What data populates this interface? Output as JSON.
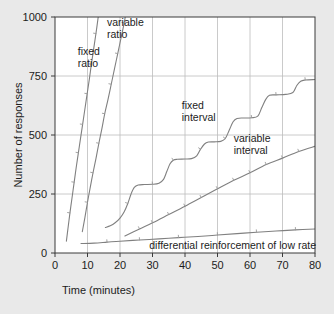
{
  "chart_data": {
    "type": "line",
    "title": "",
    "subtitle": "",
    "xlabel": "Time (minutes)",
    "ylabel": "Number of responses",
    "xlim": [
      0,
      80
    ],
    "ylim": [
      0,
      1000
    ],
    "xticks": [
      0,
      10,
      20,
      30,
      40,
      50,
      60,
      70,
      80
    ],
    "yticks": [
      0,
      250,
      500,
      750,
      1000
    ],
    "xtick_labels": [
      "0",
      "10",
      "20",
      "30",
      "40",
      "50",
      "60",
      "70",
      "80"
    ],
    "ytick_labels": [
      "0",
      "250",
      "500",
      "750",
      "1000"
    ],
    "grid": true,
    "legend_position": "inline-annotations",
    "line_color": "#808080",
    "axis_color": "#3a3a3a",
    "grid_color": "#bdbdbd",
    "plot_bg_color": "#ffffff",
    "figure_bg_color": "#e9e9e9",
    "series": [
      {
        "name": "fixed ratio",
        "label": "fixed\nratio",
        "label_lines": [
          "fixed",
          "ratio"
        ],
        "label_x": 7.0,
        "label_y": 840,
        "points": [
          [
            3.5,
            50
          ],
          [
            4.0,
            105
          ],
          [
            4.6,
            170
          ],
          [
            5.2,
            230
          ],
          [
            5.9,
            300
          ],
          [
            6.5,
            360
          ],
          [
            7.2,
            425
          ],
          [
            7.9,
            490
          ],
          [
            8.5,
            545
          ],
          [
            9.2,
            610
          ],
          [
            9.9,
            675
          ],
          [
            10.6,
            740
          ],
          [
            11.2,
            800
          ],
          [
            11.9,
            865
          ],
          [
            12.6,
            930
          ],
          [
            13.3,
            1000
          ]
        ]
      },
      {
        "name": "variable ratio",
        "label": "variable\nratio",
        "label_lines": [
          "variable",
          "ratio"
        ],
        "label_x": 16.0,
        "label_y": 960,
        "points": [
          [
            8.4,
            90
          ],
          [
            9.2,
            150
          ],
          [
            10.0,
            215
          ],
          [
            10.8,
            275
          ],
          [
            11.7,
            340
          ],
          [
            12.6,
            400
          ],
          [
            13.5,
            465
          ],
          [
            14.4,
            525
          ],
          [
            15.3,
            590
          ],
          [
            16.3,
            650
          ],
          [
            17.3,
            715
          ],
          [
            18.3,
            780
          ],
          [
            19.3,
            845
          ],
          [
            20.3,
            910
          ],
          [
            21.3,
            975
          ],
          [
            21.6,
            1000
          ]
        ]
      },
      {
        "name": "fixed interval",
        "label": "fixed\ninterval",
        "label_lines": [
          "fixed",
          "interval"
        ],
        "label_x": 39.0,
        "label_y": 610,
        "points": [
          [
            15.5,
            108
          ],
          [
            17.0,
            115
          ],
          [
            18.5,
            128
          ],
          [
            20.0,
            148
          ],
          [
            21.3,
            175
          ],
          [
            22.4,
            210
          ],
          [
            23.4,
            250
          ],
          [
            24.4,
            278
          ],
          [
            25.6,
            288
          ],
          [
            27.5,
            290
          ],
          [
            30.0,
            291
          ],
          [
            32.0,
            296
          ],
          [
            33.4,
            312
          ],
          [
            34.4,
            345
          ],
          [
            35.4,
            378
          ],
          [
            36.4,
            393
          ],
          [
            37.6,
            397
          ],
          [
            40.0,
            398
          ],
          [
            42.0,
            400
          ],
          [
            43.6,
            412
          ],
          [
            44.8,
            440
          ],
          [
            46.0,
            462
          ],
          [
            47.2,
            470
          ],
          [
            49.0,
            471
          ],
          [
            51.0,
            473
          ],
          [
            52.4,
            485
          ],
          [
            53.6,
            520
          ],
          [
            54.8,
            556
          ],
          [
            56.0,
            570
          ],
          [
            58.0,
            572
          ],
          [
            60.5,
            573
          ],
          [
            62.4,
            580
          ],
          [
            63.6,
            615
          ],
          [
            64.8,
            650
          ],
          [
            66.0,
            668
          ],
          [
            68.0,
            670
          ],
          [
            71.0,
            672
          ],
          [
            73.2,
            680
          ],
          [
            74.4,
            710
          ],
          [
            75.6,
            728
          ],
          [
            77.0,
            733
          ],
          [
            80.0,
            735
          ]
        ]
      },
      {
        "name": "variable interval",
        "label": "variable\ninterval",
        "label_lines": [
          "variable",
          "interval"
        ],
        "label_x": 55.0,
        "label_y": 470,
        "points": [
          [
            21.5,
            72
          ],
          [
            26.0,
            102
          ],
          [
            30.0,
            128
          ],
          [
            35.0,
            163
          ],
          [
            40.0,
            198
          ],
          [
            45.0,
            235
          ],
          [
            50.0,
            272
          ],
          [
            55.0,
            308
          ],
          [
            60.0,
            340
          ],
          [
            65.0,
            375
          ],
          [
            70.0,
            402
          ],
          [
            75.0,
            430
          ],
          [
            80.0,
            452
          ]
        ]
      },
      {
        "name": "differential reinforcement of low rate",
        "label": "differential reinforcement of low rate",
        "label_lines": [
          "differential reinforcement of low rate"
        ],
        "label_x": 29.0,
        "label_y": 18,
        "points": [
          [
            8.0,
            40
          ],
          [
            12.0,
            42
          ],
          [
            16.0,
            46
          ],
          [
            20.0,
            50
          ],
          [
            26.0,
            55
          ],
          [
            32.0,
            60
          ],
          [
            38.0,
            65
          ],
          [
            44.0,
            70
          ],
          [
            50.0,
            76
          ],
          [
            56.0,
            82
          ],
          [
            62.0,
            88
          ],
          [
            68.0,
            93
          ],
          [
            74.0,
            98
          ],
          [
            80.0,
            102
          ]
        ]
      }
    ]
  }
}
